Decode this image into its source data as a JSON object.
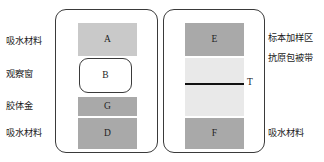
{
  "diagram": {
    "type": "lateral-flow-immunoassay-test-strip",
    "panels": [
      {
        "id": "panel-left",
        "blocks": [
          {
            "id": "A",
            "label": "A",
            "fill": "#c9c9c9",
            "shape": "rect"
          },
          {
            "id": "B",
            "label": "B",
            "fill": "#ffffff",
            "shape": "rounded-rect"
          },
          {
            "id": "G",
            "label": "G",
            "fill": "#a9a9a9",
            "shape": "rect"
          },
          {
            "id": "D",
            "label": "D",
            "fill": "#a9a9a9",
            "shape": "rect"
          }
        ]
      },
      {
        "id": "panel-right",
        "blocks": [
          {
            "id": "E",
            "label": "E",
            "fill": "#a9a9a9",
            "shape": "rect"
          },
          {
            "id": "band",
            "label": "",
            "fill": "#e9e9e9",
            "shape": "rect"
          },
          {
            "id": "F",
            "label": "F",
            "fill": "#a9a9a9",
            "shape": "rect"
          }
        ],
        "test_line": {
          "label": "T",
          "color": "#111111"
        }
      }
    ],
    "labels_left": [
      {
        "id": "left-1",
        "text": "吸水材料"
      },
      {
        "id": "left-2",
        "text": "观察窗"
      },
      {
        "id": "left-3",
        "text": "胶体金"
      },
      {
        "id": "left-4",
        "text": "吸水材料"
      }
    ],
    "labels_right": [
      {
        "id": "right-1",
        "text": "标本加样区"
      },
      {
        "id": "right-2",
        "text": "抗原包被带"
      },
      {
        "id": "right-3",
        "text": "吸水材料"
      }
    ]
  }
}
